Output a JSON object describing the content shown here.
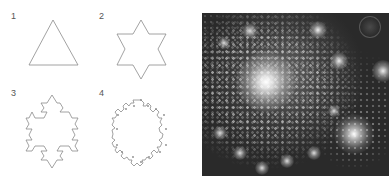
{
  "figure": {
    "panels": [
      {
        "label": "1",
        "description": "Koch snowflake iteration 1: equilateral triangle"
      },
      {
        "label": "2",
        "description": "Koch snowflake iteration 2: six-pointed star"
      },
      {
        "label": "3",
        "description": "Koch snowflake iteration 3"
      },
      {
        "label": "4",
        "description": "Koch snowflake iteration 4"
      }
    ],
    "fractal_image": {
      "description": "Grayscale Julia/Mandelbrot fractal spiral detail",
      "background_color": "#2a2a2a",
      "highlight_color": "#ffffff"
    },
    "stroke_color": "#888888"
  }
}
